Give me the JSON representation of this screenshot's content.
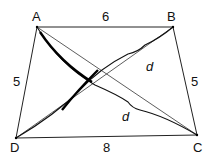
{
  "diagram": {
    "type": "trapezoid-diagonals",
    "vertices": {
      "A": {
        "label": "A",
        "x": 37,
        "y": 27
      },
      "B": {
        "label": "B",
        "x": 173,
        "y": 27
      },
      "C": {
        "label": "C",
        "x": 197,
        "y": 135
      },
      "D": {
        "label": "D",
        "x": 16,
        "y": 138
      }
    },
    "sides": {
      "AB": "6",
      "AD": "5",
      "BC": "5",
      "DC": "8"
    },
    "diagonal_labels": {
      "BD": "d",
      "AC": "d"
    }
  }
}
